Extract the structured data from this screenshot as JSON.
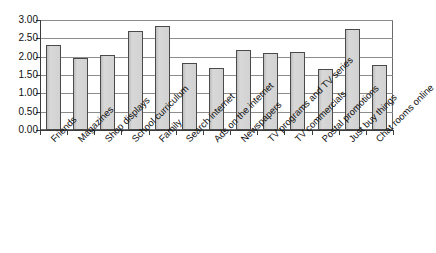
{
  "chart_data": {
    "type": "bar",
    "title": "",
    "subtitle": "",
    "xlabel": "",
    "ylabel": "",
    "ylim": [
      0,
      3.0
    ],
    "ytick_step": 0.5,
    "grid": true,
    "legend": false,
    "legend_position": "none",
    "bar_fill_color": "#d2d2d2",
    "bar_edge_color": "#4a4a4a",
    "axis_color": "#3b3b3b",
    "grid_color": "#8c8c8c",
    "categories": [
      "Friends",
      "Magazines",
      "Shop displays",
      "School curriculum",
      "Family",
      "Search internet",
      "Ads on the internet",
      "Newspapers",
      "TV programs and TV series",
      "TV commercials",
      "Postal promotions",
      "Just buy things",
      "Chat rooms online"
    ],
    "values": [
      2.31,
      1.97,
      2.05,
      2.69,
      2.85,
      1.83,
      1.68,
      2.17,
      2.11,
      2.12,
      1.66,
      2.76,
      1.76
    ],
    "ytick_labels": [
      "0.00",
      "0.50",
      "1.00",
      "1.50",
      "2.00",
      "2.50",
      "3.00"
    ],
    "ytick_values": [
      0,
      0.5,
      1.0,
      1.5,
      2.0,
      2.5,
      3.0
    ]
  }
}
